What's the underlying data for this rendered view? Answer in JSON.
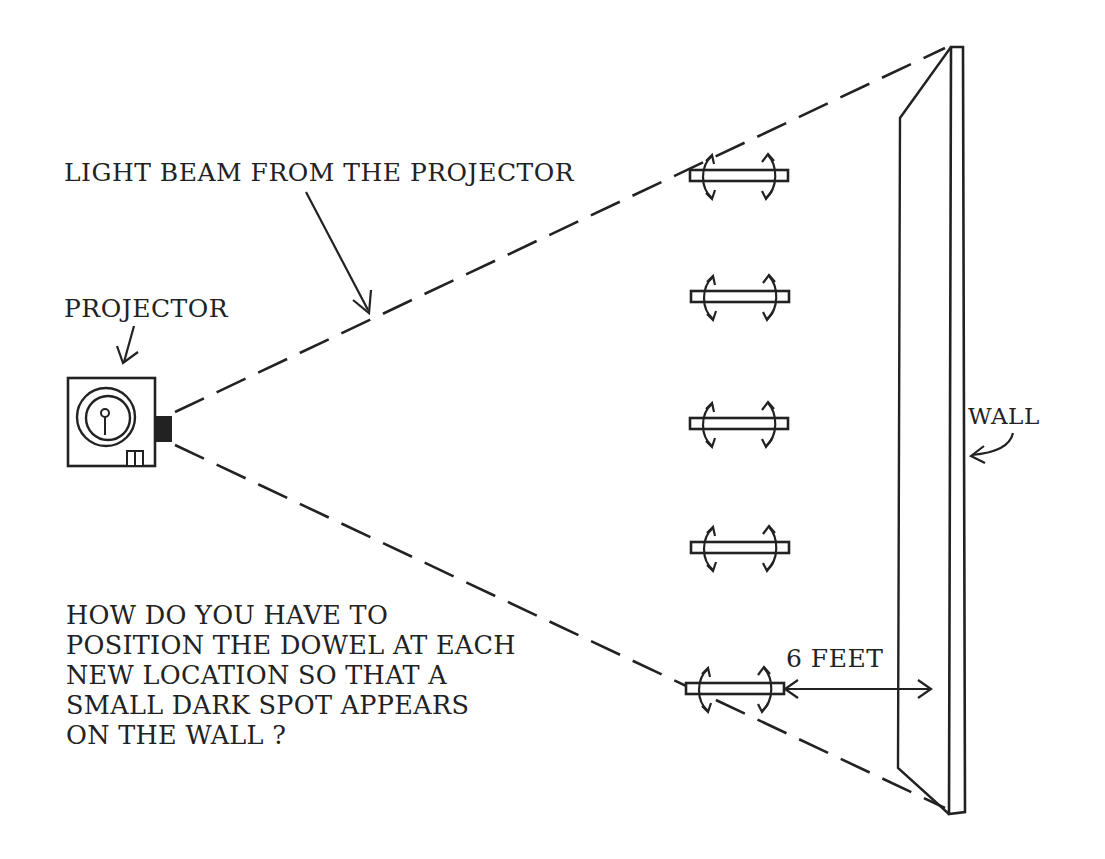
{
  "diagram": {
    "ink_color": "#222222",
    "background": "#ffffff",
    "labels": {
      "light_beam": "LIGHT BEAM FROM THE PROJECTOR",
      "projector": "PROJECTOR",
      "wall": "WALL",
      "distance": "6 FEET"
    },
    "question": {
      "lines": [
        "HOW DO YOU HAVE TO",
        "POSITION THE DOWEL AT EACH",
        "NEW LOCATION SO THAT A",
        "SMALL DARK SPOT APPEARS",
        "ON THE WALL ?"
      ]
    },
    "dowels": [
      {
        "id": 1,
        "y": 177
      },
      {
        "id": 2,
        "y": 297
      },
      {
        "id": 3,
        "y": 423
      },
      {
        "id": 4,
        "y": 548
      },
      {
        "id": 5,
        "y": 688
      }
    ],
    "icons": {
      "projector": "projector-icon",
      "dowel_rotate": "rotate-arrows-icon",
      "double_arrow": "double-headed-arrow-icon"
    }
  }
}
